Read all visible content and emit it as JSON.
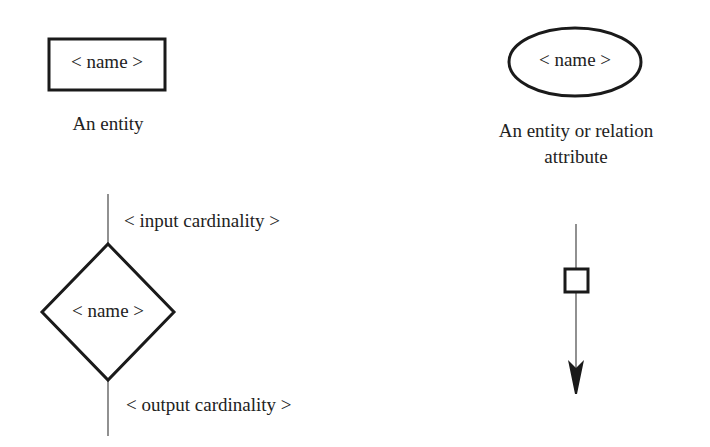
{
  "legend": {
    "entity": {
      "shape": "rectangle",
      "name_placeholder": "< name >",
      "caption": "An entity"
    },
    "attribute": {
      "shape": "ellipse",
      "name_placeholder": "< name >",
      "caption_line1": "An entity or relation",
      "caption_line2": "attribute"
    },
    "relation": {
      "shape": "diamond",
      "name_placeholder": "< name >",
      "input_label": "< input cardinality >",
      "output_label": "< output cardinality >"
    },
    "flow": {
      "shape": "arrow-with-square"
    }
  },
  "colors": {
    "stroke": "#1a1a1a",
    "thin_line": "#555555",
    "text": "#222222",
    "background": "#ffffff"
  }
}
